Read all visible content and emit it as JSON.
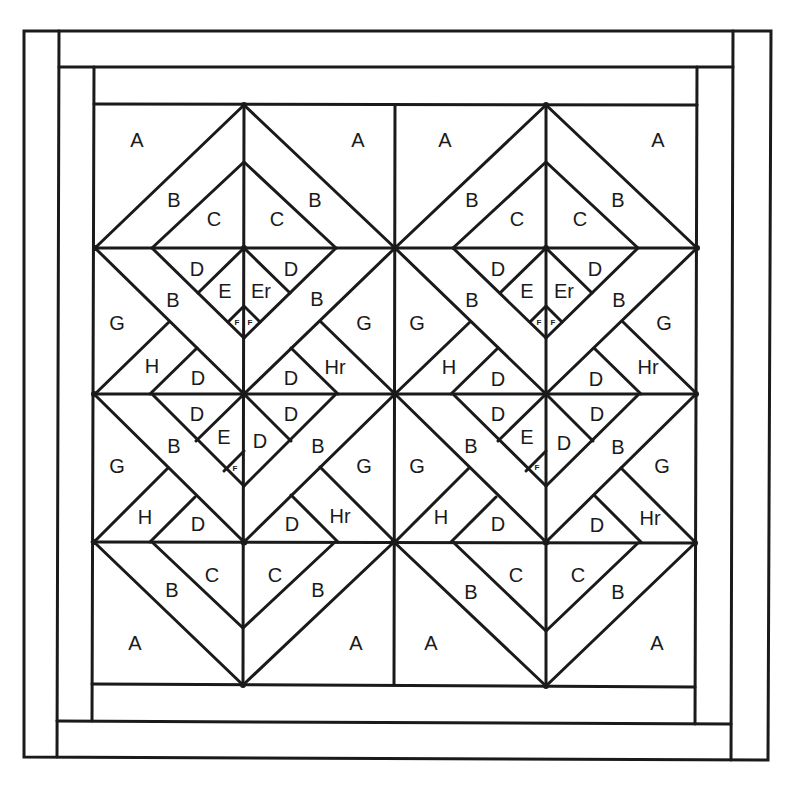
{
  "diagram": {
    "background": "#ffffff",
    "stroke_color": "#1a1a1a",
    "border": {
      "outer_rect": [
        24,
        31,
        770,
        759
      ],
      "strips": [
        {
          "name": "outer-left-strip",
          "line": [
            59,
            31,
            57,
            759
          ]
        },
        {
          "name": "outer-top-strip",
          "line": [
            59,
            67,
            733,
            67
          ]
        },
        {
          "name": "outer-right-strip",
          "line": [
            733,
            31,
            731,
            759
          ]
        },
        {
          "name": "outer-bottom-strip",
          "line": [
            57,
            723,
            731,
            723
          ]
        },
        {
          "name": "inner-left-strip",
          "line": [
            94,
            67,
            92,
            723
          ]
        },
        {
          "name": "inner-top-strip",
          "line": [
            94,
            104,
            697,
            104
          ]
        },
        {
          "name": "inner-right-strip",
          "line": [
            697,
            67,
            695,
            723
          ]
        },
        {
          "name": "inner-bottom-strip",
          "line": [
            92,
            686,
            695,
            686
          ]
        }
      ]
    },
    "block_lines": {
      "verticals": [
        [
          395,
          104,
          394,
          686
        ],
        [
          244,
          104,
          244,
          686
        ],
        [
          546,
          104,
          546,
          686
        ]
      ],
      "horizontals": [
        [
          94,
          248,
          697,
          248
        ],
        [
          93,
          394,
          696,
          394
        ],
        [
          92,
          542,
          695,
          542
        ]
      ]
    },
    "labels": [
      {
        "text": "A",
        "x": 137,
        "y": 140,
        "size": "lg"
      },
      {
        "text": "A",
        "x": 358,
        "y": 140,
        "size": "lg"
      },
      {
        "text": "B",
        "x": 174,
        "y": 200,
        "size": "lg"
      },
      {
        "text": "C",
        "x": 214,
        "y": 219,
        "size": "lg"
      },
      {
        "text": "C",
        "x": 277,
        "y": 219,
        "size": "lg"
      },
      {
        "text": "B",
        "x": 315,
        "y": 200,
        "size": "lg"
      },
      {
        "text": "D",
        "x": 197,
        "y": 269,
        "size": "lg"
      },
      {
        "text": "D",
        "x": 291,
        "y": 269,
        "size": "lg"
      },
      {
        "text": "E",
        "x": 225,
        "y": 291,
        "size": "lg"
      },
      {
        "text": "Er",
        "x": 261,
        "y": 291,
        "size": "lg"
      },
      {
        "text": "F",
        "x": 237,
        "y": 322,
        "size": "sm"
      },
      {
        "text": "F",
        "x": 250,
        "y": 322,
        "size": "sm"
      },
      {
        "text": "B",
        "x": 173,
        "y": 300,
        "size": "lg"
      },
      {
        "text": "B",
        "x": 317,
        "y": 299,
        "size": "lg"
      },
      {
        "text": "G",
        "x": 117,
        "y": 323,
        "size": "lg"
      },
      {
        "text": "G",
        "x": 364,
        "y": 323,
        "size": "lg"
      },
      {
        "text": "H",
        "x": 152,
        "y": 366,
        "size": "lg"
      },
      {
        "text": "D",
        "x": 198,
        "y": 378,
        "size": "lg"
      },
      {
        "text": "D",
        "x": 291,
        "y": 378,
        "size": "lg"
      },
      {
        "text": "Hr",
        "x": 335,
        "y": 367,
        "size": "lg"
      },
      {
        "text": "D",
        "x": 197,
        "y": 414,
        "size": "lg"
      },
      {
        "text": "D",
        "x": 291,
        "y": 414,
        "size": "lg"
      },
      {
        "text": "E",
        "x": 224,
        "y": 437,
        "size": "lg"
      },
      {
        "text": "D",
        "x": 260,
        "y": 441,
        "size": "lg"
      },
      {
        "text": "F",
        "x": 235,
        "y": 468,
        "size": "sm"
      },
      {
        "text": "B",
        "x": 174,
        "y": 446,
        "size": "lg"
      },
      {
        "text": "B",
        "x": 318,
        "y": 446,
        "size": "lg"
      },
      {
        "text": "G",
        "x": 117,
        "y": 466,
        "size": "lg"
      },
      {
        "text": "G",
        "x": 364,
        "y": 466,
        "size": "lg"
      },
      {
        "text": "H",
        "x": 145,
        "y": 517,
        "size": "lg"
      },
      {
        "text": "D",
        "x": 198,
        "y": 524,
        "size": "lg"
      },
      {
        "text": "D",
        "x": 292,
        "y": 524,
        "size": "lg"
      },
      {
        "text": "Hr",
        "x": 340,
        "y": 516,
        "size": "lg"
      },
      {
        "text": "C",
        "x": 212,
        "y": 575,
        "size": "lg"
      },
      {
        "text": "C",
        "x": 275,
        "y": 575,
        "size": "lg"
      },
      {
        "text": "B",
        "x": 172,
        "y": 590,
        "size": "lg"
      },
      {
        "text": "B",
        "x": 318,
        "y": 590,
        "size": "lg"
      },
      {
        "text": "A",
        "x": 135,
        "y": 643,
        "size": "lg"
      },
      {
        "text": "A",
        "x": 356,
        "y": 643,
        "size": "lg"
      },
      {
        "text": "A",
        "x": 445,
        "y": 140,
        "size": "lg"
      },
      {
        "text": "A",
        "x": 658,
        "y": 140,
        "size": "lg"
      },
      {
        "text": "B",
        "x": 472,
        "y": 200,
        "size": "lg"
      },
      {
        "text": "C",
        "x": 517,
        "y": 219,
        "size": "lg"
      },
      {
        "text": "C",
        "x": 580,
        "y": 219,
        "size": "lg"
      },
      {
        "text": "B",
        "x": 618,
        "y": 200,
        "size": "lg"
      },
      {
        "text": "D",
        "x": 498,
        "y": 269,
        "size": "lg"
      },
      {
        "text": "D",
        "x": 595,
        "y": 269,
        "size": "lg"
      },
      {
        "text": "E",
        "x": 527,
        "y": 291,
        "size": "lg"
      },
      {
        "text": "Er",
        "x": 564,
        "y": 291,
        "size": "lg"
      },
      {
        "text": "F",
        "x": 539,
        "y": 322,
        "size": "sm"
      },
      {
        "text": "F",
        "x": 553,
        "y": 322,
        "size": "sm"
      },
      {
        "text": "B",
        "x": 472,
        "y": 300,
        "size": "lg"
      },
      {
        "text": "B",
        "x": 619,
        "y": 300,
        "size": "lg"
      },
      {
        "text": "G",
        "x": 417,
        "y": 323,
        "size": "lg"
      },
      {
        "text": "G",
        "x": 664,
        "y": 323,
        "size": "lg"
      },
      {
        "text": "H",
        "x": 449,
        "y": 367,
        "size": "lg"
      },
      {
        "text": "D",
        "x": 498,
        "y": 379,
        "size": "lg"
      },
      {
        "text": "D",
        "x": 596,
        "y": 379,
        "size": "lg"
      },
      {
        "text": "Hr",
        "x": 648,
        "y": 367,
        "size": "lg"
      },
      {
        "text": "D",
        "x": 498,
        "y": 414,
        "size": "lg"
      },
      {
        "text": "D",
        "x": 597,
        "y": 414,
        "size": "lg"
      },
      {
        "text": "E",
        "x": 527,
        "y": 437,
        "size": "lg"
      },
      {
        "text": "D",
        "x": 564,
        "y": 443,
        "size": "lg"
      },
      {
        "text": "F",
        "x": 537,
        "y": 467,
        "size": "sm"
      },
      {
        "text": "B",
        "x": 471,
        "y": 446,
        "size": "lg"
      },
      {
        "text": "B",
        "x": 618,
        "y": 447,
        "size": "lg"
      },
      {
        "text": "G",
        "x": 417,
        "y": 466,
        "size": "lg"
      },
      {
        "text": "G",
        "x": 662,
        "y": 466,
        "size": "lg"
      },
      {
        "text": "H",
        "x": 441,
        "y": 517,
        "size": "lg"
      },
      {
        "text": "D",
        "x": 498,
        "y": 524,
        "size": "lg"
      },
      {
        "text": "D",
        "x": 597,
        "y": 525,
        "size": "lg"
      },
      {
        "text": "Hr",
        "x": 650,
        "y": 518,
        "size": "lg"
      },
      {
        "text": "C",
        "x": 516,
        "y": 575,
        "size": "lg"
      },
      {
        "text": "C",
        "x": 578,
        "y": 575,
        "size": "lg"
      },
      {
        "text": "B",
        "x": 471,
        "y": 592,
        "size": "lg"
      },
      {
        "text": "B",
        "x": 618,
        "y": 592,
        "size": "lg"
      },
      {
        "text": "A",
        "x": 431,
        "y": 643,
        "size": "lg"
      },
      {
        "text": "A",
        "x": 657,
        "y": 643,
        "size": "lg"
      }
    ],
    "legend_patch_letters": [
      "A",
      "B",
      "C",
      "D",
      "E",
      "Er",
      "F",
      "G",
      "H",
      "Hr"
    ]
  }
}
